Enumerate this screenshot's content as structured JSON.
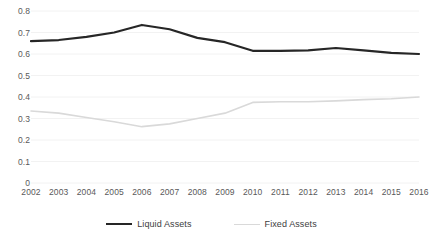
{
  "chart_data": {
    "type": "line",
    "title": "",
    "xlabel": "",
    "ylabel": "",
    "grid": true,
    "gridlines": "horizontal",
    "legend_position": "bottom",
    "x": [
      "2002",
      "2003",
      "2004",
      "2005",
      "2006",
      "2007",
      "2008",
      "2009",
      "2010",
      "2011",
      "2012",
      "2013",
      "2014",
      "2015",
      "2016"
    ],
    "xlim": [
      "2002",
      "2016"
    ],
    "ylim": [
      0,
      0.8
    ],
    "yticks": [
      "0",
      "0.1",
      "0.2",
      "0.3",
      "0.4",
      "0.5",
      "0.6",
      "0.7",
      "0.8"
    ],
    "ytick_values": [
      0,
      0.1,
      0.2,
      0.3,
      0.4,
      0.5,
      0.6,
      0.7,
      0.8
    ],
    "series": [
      {
        "name": "Liquid Assets",
        "color": "#262626",
        "line_width": 2.2,
        "values": [
          0.66,
          0.665,
          0.68,
          0.7,
          0.735,
          0.715,
          0.675,
          0.655,
          0.615,
          0.615,
          0.617,
          0.628,
          0.617,
          0.605,
          0.6
        ]
      },
      {
        "name": "Fixed Assets",
        "color": "#d9d9d9",
        "line_width": 1.6,
        "values": [
          0.335,
          0.325,
          0.305,
          0.285,
          0.262,
          0.275,
          0.3,
          0.325,
          0.375,
          0.378,
          0.378,
          0.382,
          0.388,
          0.392,
          0.4
        ]
      }
    ]
  },
  "legend": {
    "items": [
      {
        "label": "Liquid Assets",
        "color": "#262626",
        "width": 2.2
      },
      {
        "label": "Fixed Assets",
        "color": "#d9d9d9",
        "width": 1.6
      }
    ]
  },
  "axis_colors": {
    "grid": "#f2f2f2",
    "tick_text": "#595959"
  }
}
